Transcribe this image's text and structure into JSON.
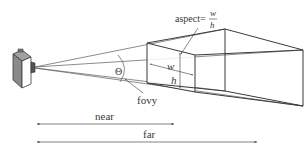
{
  "diagram": {
    "type": "view-frustum",
    "labels": {
      "theta": "Θ",
      "fovy": "fovy",
      "aspect_prefix": "aspect=",
      "aspect_num": "w",
      "aspect_den": "h",
      "width": "w",
      "height": "h",
      "near": "near",
      "far": "far"
    },
    "elements": {
      "camera": "camera-icon",
      "near_plane": "near-clipping-plane",
      "far_plane": "far-clipping-plane"
    },
    "colors": {
      "line": "#4a4a4a",
      "camera_body": "#8a8a8a",
      "camera_front": "#ffffff",
      "text": "#3a3a3a"
    }
  }
}
